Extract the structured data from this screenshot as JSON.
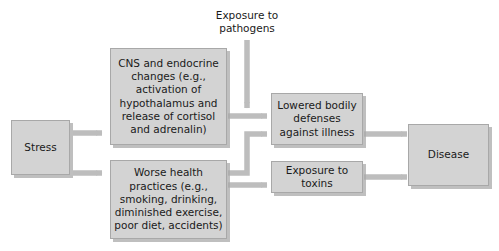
{
  "diagram": {
    "colors": {
      "node_fill": "#d3d3d3",
      "node_border": "#a8a8a8",
      "connector": "#bdbdbd",
      "text": "#1a1a1a",
      "background": "#ffffff"
    },
    "nodes": [
      {
        "id": "stress",
        "label": "Stress"
      },
      {
        "id": "cns",
        "label": "CNS and endocrine changes (e.g., activation of hypothalamus and release of cortisol and adrenalin)"
      },
      {
        "id": "worse_health",
        "label": "Worse health practices (e.g., smoking, drinking, diminished exercise, poor diet, accidents)"
      },
      {
        "id": "lowered_defenses",
        "label": "Lowered bodily defenses against illness"
      },
      {
        "id": "toxins",
        "label": "Exposure to toxins"
      },
      {
        "id": "disease",
        "label": "Disease"
      }
    ],
    "labels": [
      {
        "id": "pathogens",
        "label": "Exposure to pathogens"
      }
    ],
    "edges": [
      {
        "from": "stress",
        "to": "cns"
      },
      {
        "from": "stress",
        "to": "worse_health"
      },
      {
        "from": "cns",
        "to": "lowered_defenses"
      },
      {
        "from": "worse_health",
        "to": "lowered_defenses"
      },
      {
        "from": "worse_health",
        "to": "toxins"
      },
      {
        "from": "pathogens",
        "to": "lowered_defenses"
      },
      {
        "from": "lowered_defenses",
        "to": "disease"
      },
      {
        "from": "toxins",
        "to": "disease"
      }
    ]
  }
}
